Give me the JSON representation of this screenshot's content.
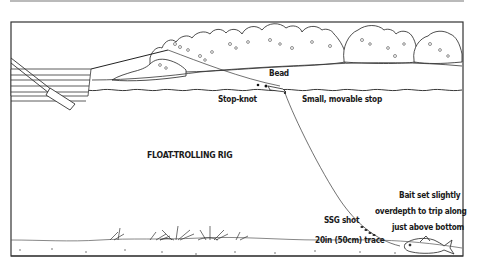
{
  "diagram": {
    "title": "FLOAT-TROLLING RIG",
    "labels": {
      "bead": "Bead",
      "stop_knot": "Stop-knot",
      "small_stop": "Small, movable stop",
      "ssg_shot": "SSG shot",
      "trace": "20in (50cm) trace",
      "bait_line1": "Bait set slightly",
      "bait_line2": "overdepth to trip along",
      "bait_line3": "just above bottom"
    },
    "elements": [
      "boat",
      "oar",
      "rod-line",
      "bushes",
      "far-bank",
      "water-surface",
      "float",
      "bead",
      "stop-knot",
      "main-line",
      "ssg-shot",
      "trace",
      "bait-fish",
      "weeds",
      "river-bed"
    ],
    "colors": {
      "ink": "#1a1a1a",
      "background": "#ffffff",
      "border": "#333333"
    }
  }
}
